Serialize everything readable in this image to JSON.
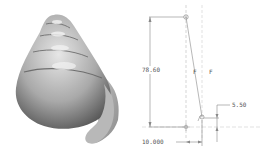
{
  "figure": {
    "left_panel": {
      "description": "3D shaded render of a conical spiral shell"
    },
    "right_panel": {
      "description": "2D sketch with dimensions",
      "dimensions": {
        "height": "78.60",
        "offset_right": "5.50",
        "offset_bottom": "10.000"
      },
      "labels": {
        "f1": "F",
        "f2": "F"
      }
    }
  }
}
